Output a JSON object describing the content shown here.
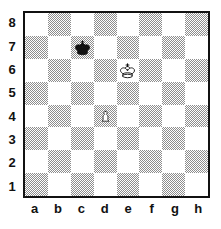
{
  "diagram": {
    "kind": "chess-board-diagram",
    "orientation": "white-bottom",
    "board_size": 8,
    "border_color": "#111111",
    "light_square_color": "#ffffff",
    "dark_square_color": "#8d8d8d",
    "rank_labels": [
      "8",
      "7",
      "6",
      "5",
      "4",
      "3",
      "2",
      "1"
    ],
    "file_labels": [
      "a",
      "b",
      "c",
      "d",
      "e",
      "f",
      "g",
      "h"
    ],
    "pieces": [
      {
        "square": "c7",
        "color": "black",
        "type": "king",
        "glyph": "black-king-icon"
      },
      {
        "square": "e6",
        "color": "white",
        "type": "king",
        "glyph": "white-king-icon"
      },
      {
        "square": "d4",
        "color": "white",
        "type": "pawn",
        "glyph": "white-pawn-icon"
      }
    ],
    "fen_placement": "8/2k5/4K3/8/3P4/8/8/8"
  }
}
